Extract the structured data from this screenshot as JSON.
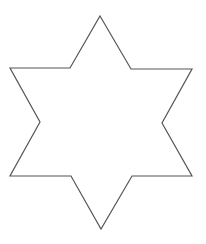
{
  "figure": {
    "width": 206,
    "height": 244,
    "background": "#ffffff",
    "shape": {
      "type": "hexagram-outline",
      "label": "six-pointed star",
      "stroke": "#555555",
      "stroke_width": 1.2,
      "fill": "none",
      "points": "100,16 131,69 192,69 162,123 192,176 132,176 101,229 71,176 10,176 40,122 10,68 70,68"
    }
  }
}
